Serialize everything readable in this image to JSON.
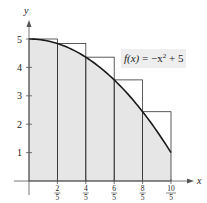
{
  "function": {
    "label_fx": "f(x)",
    "label_eq": " = −x",
    "label_exp": "2",
    "label_tail": " + 5",
    "formula": "f(x) = -x^2 + 5"
  },
  "axes": {
    "x_label": "x",
    "y_label": "y",
    "y_ticks": [
      "1",
      "2",
      "3",
      "4",
      "5"
    ],
    "x_ticks": [
      {
        "num": "2",
        "den": "5"
      },
      {
        "num": "4",
        "den": "5"
      },
      {
        "num": "6",
        "den": "5"
      },
      {
        "num": "8",
        "den": "5"
      },
      {
        "num": "10",
        "den": "5"
      }
    ]
  },
  "rectangles": [
    {
      "x_left": 0.0,
      "x_right": 0.4,
      "height": 5.0
    },
    {
      "x_left": 0.4,
      "x_right": 0.8,
      "height": 4.84
    },
    {
      "x_left": 0.8,
      "x_right": 1.2,
      "height": 4.36
    },
    {
      "x_left": 1.2,
      "x_right": 1.6,
      "height": 3.56
    },
    {
      "x_left": 1.6,
      "x_right": 2.0,
      "height": 2.44
    }
  ],
  "colors": {
    "fill": "#e6e6e6",
    "stroke": "#333333",
    "curve": "#1a1a1a",
    "label_bg": "#eeeeee"
  }
}
